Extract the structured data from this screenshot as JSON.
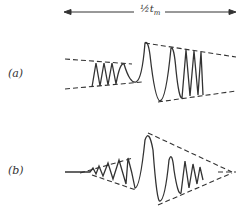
{
  "figure": {
    "span_arrow": {
      "label_fraction": "½",
      "label_var": "t",
      "label_sub": "m"
    },
    "panels": [
      {
        "id": "a",
        "label": "(a)",
        "description": "chirped wave packet with constant-ish envelope: low-amplitude fast oscillations, then large-amplitude oscillations with dashed envelope lines"
      },
      {
        "id": "b",
        "label": "(b)",
        "description": "wave packet with envelope growing to a peak then decaying, dashed converging envelope lines"
      }
    ],
    "colors": {
      "stroke": "#333333",
      "background": "#ffffff"
    }
  }
}
